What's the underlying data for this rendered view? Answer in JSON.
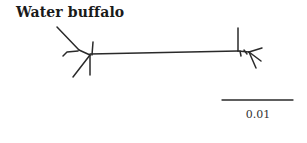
{
  "figure": {
    "title": "Water buffalo",
    "scale_bar": {
      "label": "0.01"
    }
  },
  "tree": {
    "type": "unrooted-phylogenetic-tree",
    "clusters": [
      "left-cluster",
      "right-cluster"
    ],
    "line_color": "#2a2a2a"
  }
}
